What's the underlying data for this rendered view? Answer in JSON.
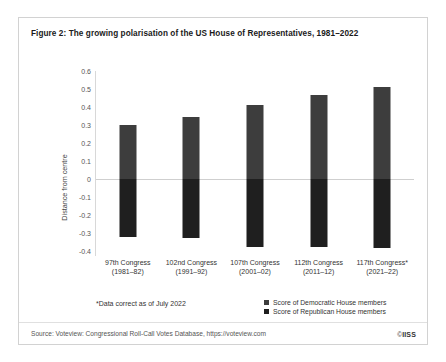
{
  "figure": {
    "title": "Figure 2: The growing polarisation of the US House of Representatives, 1981–2022",
    "footnote": "*Data correct as of July 2022",
    "source": "Source: Voteview: Congressional Roll-Call Votes Database, https://voteview.com",
    "copyright_symbol": "©",
    "copyright_owner": "IISS"
  },
  "colors": {
    "democratic_bar": "#3d3d3d",
    "republican_bar": "#1f1f1f",
    "zero_line": "#cfcfcf",
    "axis_line": "#d8d8d8",
    "card_border": "#d2d2d2"
  },
  "legend": {
    "position": "bottom-right",
    "items": [
      {
        "label": "Score of Democratic House members",
        "color": "#3d3d3d"
      },
      {
        "label": "Score of Republican House members",
        "color": "#1f1f1f"
      }
    ]
  },
  "chart_data": {
    "type": "bar",
    "title": "Figure 2: The growing polarisation of the US House of Representatives, 1981–2022",
    "subtitle": "",
    "xlabel": "",
    "ylabel": "Distance from centre",
    "ylim": [
      -0.4,
      0.6
    ],
    "grid": false,
    "zero_line": true,
    "ytick_labels": [
      "0.6",
      "0.5",
      "0.4",
      "0.3",
      "0.2",
      "0.1",
      "0",
      "-0.1",
      "-0.2",
      "-0.3",
      "-0.4"
    ],
    "yticks": [
      0.6,
      0.5,
      0.4,
      0.3,
      0.2,
      0.1,
      0,
      -0.1,
      -0.2,
      -0.3,
      -0.4
    ],
    "categories": [
      "97th Congress\n(1981–82)",
      "102nd Congress\n(1991–92)",
      "107th Congress\n(2001–02)",
      "112th Congress\n(2011–12)",
      "117th Congress*\n(2021–22)"
    ],
    "category_lines": [
      [
        "97th Congress",
        "(1981–82)"
      ],
      [
        "102nd Congress",
        "(1991–92)"
      ],
      [
        "107th Congress",
        "(2001–02)"
      ],
      [
        "112th Congress",
        "(2011–12)"
      ],
      [
        "117th Congress*",
        "(2021–22)"
      ]
    ],
    "series": [
      {
        "name": "Score of Democratic House members",
        "color": "#3d3d3d",
        "values": [
          0.3,
          0.345,
          0.41,
          0.465,
          0.51
        ]
      },
      {
        "name": "Score of Republican House members",
        "color": "#1f1f1f",
        "values": [
          -0.32,
          -0.325,
          -0.375,
          -0.38,
          -0.385
        ]
      }
    ],
    "annotations": [
      "*Data correct as of July 2022"
    ]
  }
}
